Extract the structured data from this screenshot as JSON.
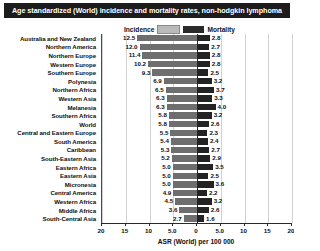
{
  "title": "Age standardized (World) incidence and mortality rates, non-hodgkin lymphoma",
  "legend": {
    "incidence_label": "Incidence",
    "mortality_label": "Mortality",
    "incidence_color": "#b9b9b9",
    "mortality_color": "#2a2a2a"
  },
  "axis": {
    "x_title": "ASR (World) per 100 000",
    "ticks": [
      "20",
      "15",
      "10",
      "5.0",
      "0",
      "5.0",
      "10",
      "15",
      "20"
    ]
  },
  "chart_data": {
    "type": "bar",
    "title": "Age standardized (World) incidence and mortality rates, non-hodgkin lymphoma",
    "xlabel": "ASR (World) per 100 000",
    "ylabel": "",
    "orientation": "horizontal-diverging",
    "xlim": [
      -20,
      20
    ],
    "xticks": [
      -20,
      -15,
      -10,
      -5,
      0,
      5,
      10,
      15,
      20
    ],
    "xticklabels": [
      "20",
      "15",
      "10",
      "5.0",
      "0",
      "5.0",
      "10",
      "15",
      "20"
    ],
    "grid": true,
    "legend_position": "top-center",
    "categories": [
      "Australia and New Zealand",
      "Northern America",
      "Northern Europe",
      "Western Europe",
      "Southern Europe",
      "Polynesia",
      "Northern Africa",
      "Western Asia",
      "Melanesia",
      "Southern Africa",
      "World",
      "Central and Eastern Europe",
      "South America",
      "Caribbean",
      "South-Eastern Asia",
      "Eastern Africa",
      "Eastern Asia",
      "Micronesia",
      "Central America",
      "Western Africa",
      "Middle Africa",
      "South-Central Asia"
    ],
    "series": [
      {
        "name": "Incidence",
        "color": "#6e6e6e",
        "side": "left",
        "values": [
          12.5,
          12.0,
          11.4,
          10.2,
          9.3,
          6.9,
          6.5,
          6.3,
          6.3,
          5.8,
          5.8,
          5.5,
          5.4,
          5.3,
          5.2,
          5.0,
          5.0,
          5.0,
          4.9,
          4.5,
          3.6,
          2.7
        ]
      },
      {
        "name": "Mortality",
        "color": "#232323",
        "side": "right",
        "values": [
          2.8,
          2.7,
          2.8,
          2.8,
          2.5,
          3.2,
          3.7,
          3.3,
          4.0,
          3.2,
          2.6,
          2.3,
          2.4,
          2.7,
          2.9,
          3.5,
          2.5,
          3.6,
          2.2,
          3.2,
          2.6,
          1.6
        ]
      }
    ]
  }
}
